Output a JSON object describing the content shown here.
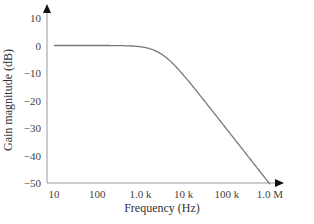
{
  "chart_data": {
    "type": "line",
    "title": "",
    "xlabel": "Frequency (Hz)",
    "ylabel": "Gain magnitude (dB)",
    "xscale": "log",
    "x_ticks": [
      "10",
      "100",
      "1.0 k",
      "10 k",
      "100 k",
      "1.0 M"
    ],
    "y_ticks": [
      "10",
      "0",
      "−10",
      "−20",
      "−30",
      "−40",
      "−50"
    ],
    "xlim": [
      10,
      1000000
    ],
    "ylim": [
      -50,
      10
    ],
    "grid": false,
    "legend": null,
    "series": [
      {
        "name": "Gain magnitude",
        "color": "#777777",
        "x": [
          10,
          100,
          300,
          1000,
          2000,
          3000,
          5000,
          10000,
          30000,
          100000,
          300000,
          1000000
        ],
        "y": [
          0,
          0,
          0,
          -0.4,
          -1.5,
          -3,
          -5.5,
          -10.5,
          -20,
          -30.5,
          -40,
          -50.5
        ]
      }
    ]
  },
  "axes": {
    "x_label": "Frequency (Hz)",
    "y_label": "Gain magnitude (dB)",
    "x_tick_labels": [
      "10",
      "100",
      "1.0 k",
      "10 k",
      "100 k",
      "1.0 M"
    ],
    "y_tick_labels": [
      "10",
      "0",
      "−10",
      "−20",
      "−30",
      "−40",
      "−50"
    ]
  }
}
